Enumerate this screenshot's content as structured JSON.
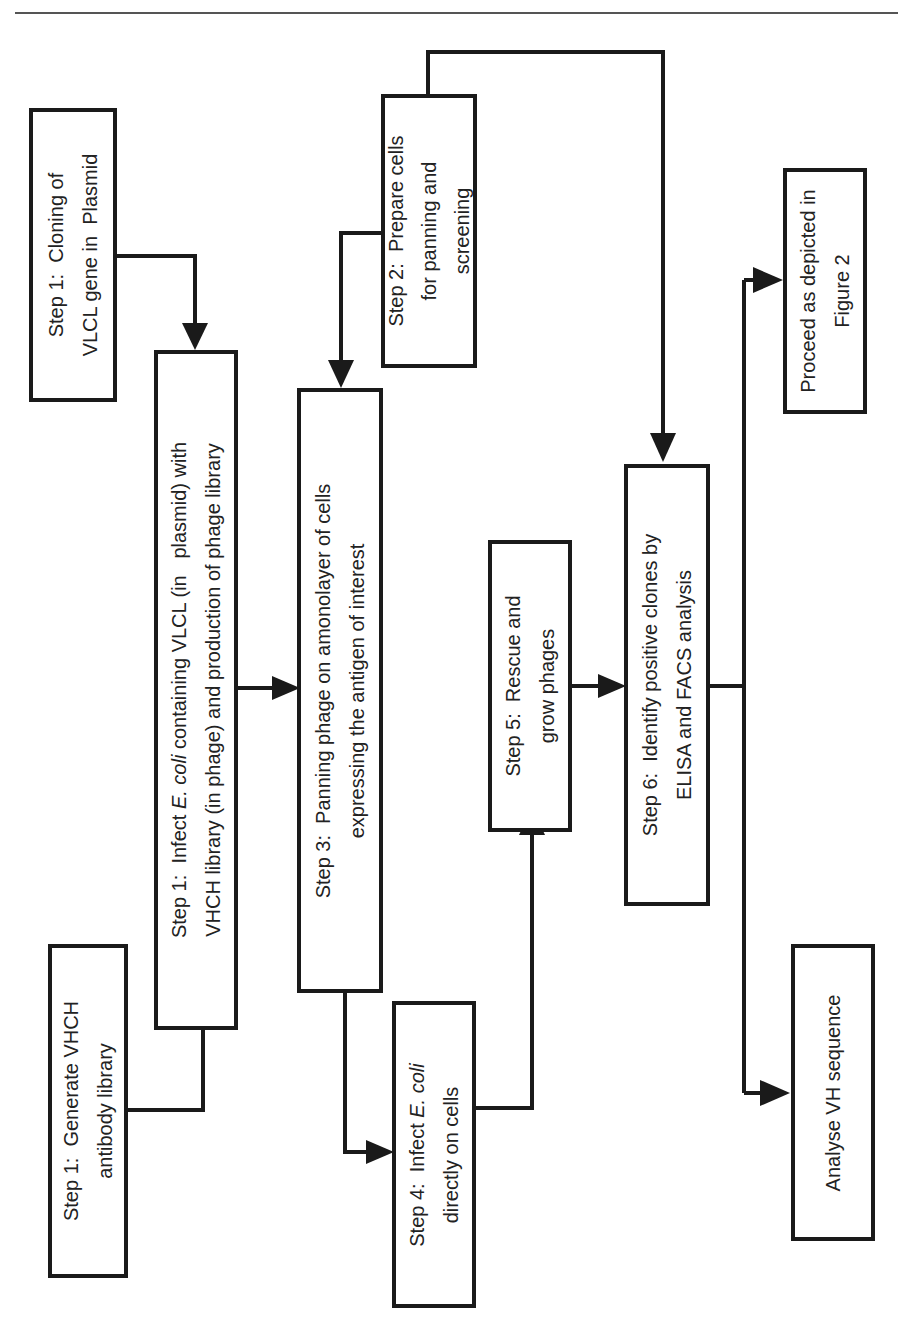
{
  "diagram": {
    "type": "flowchart",
    "orientation": "rotated-90-ccw",
    "colors": {
      "stroke": "#1a1a1a",
      "text": "#222222",
      "background": "#ffffff",
      "rule": "#555555"
    },
    "boxes": {
      "gen_library": {
        "line1": "Step 1:  Generate VHCH",
        "line2": "antibody library"
      },
      "cloning": {
        "line1": "Step 1:  Cloning of",
        "line2": "VLCL gene in  Plasmid"
      },
      "infect_ecoli": {
        "line1_pre": "Step 1:  Infect ",
        "line1_italic": "E. coli",
        "line1_post": " containing VLCL (in   plasmid) with",
        "line2": "VHCH library (in phage) and production of phage library"
      },
      "prepare_cells": {
        "line1": "Step 2:  Prepare cells",
        "line2": "for panning and",
        "line3": "screening"
      },
      "panning": {
        "line1": "Step 3:  Panning phage on amonolayer of cells",
        "line2": "expressing the antigen of interest"
      },
      "infect_direct": {
        "line1_pre": "Step 4:  Infect ",
        "line1_italic": "E. coli",
        "line2": "directly on cells"
      },
      "rescue": {
        "line1": "Step 5:  Rescue and",
        "line2": "grow phages"
      },
      "identify": {
        "line1": "Step 6:  Identify positive clones by",
        "line2": "ELISA and FACS analysis"
      },
      "proceed": {
        "line1": "Proceed as depicted in",
        "line2": "Figure 2"
      },
      "analyse": {
        "line1": "Analyse VH sequence"
      }
    },
    "edges": [
      {
        "from": "Step 1: Generate VHCH antibody library",
        "to": "Step 1: Infect E. coli"
      },
      {
        "from": "Step 1: Cloning of VLCL gene",
        "to": "Step 1: Infect E. coli"
      },
      {
        "from": "Step 1: Infect E. coli",
        "to": "Step 3: Panning"
      },
      {
        "from": "Step 2: Prepare cells",
        "to": "Step 3: Panning"
      },
      {
        "from": "Step 2: Prepare cells",
        "to": "Step 6: Identify positive clones"
      },
      {
        "from": "Step 3: Panning",
        "to": "Step 4: Infect E. coli directly"
      },
      {
        "from": "Step 4: Infect E. coli directly",
        "to": "Step 5: Rescue and grow phages"
      },
      {
        "from": "Step 5: Rescue and grow phages",
        "to": "Step 6: Identify positive clones"
      },
      {
        "from": "Step 6: Identify positive clones",
        "to": "Proceed as depicted in Figure 2"
      },
      {
        "from": "Step 6: Identify positive clones",
        "to": "Analyse VH sequence"
      }
    ]
  }
}
